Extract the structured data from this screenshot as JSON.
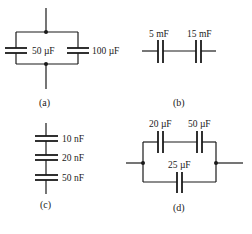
{
  "figure": {
    "panels": [
      {
        "id": "a",
        "caption": "(a)",
        "topology": "parallel",
        "capacitors": [
          {
            "label": "50 µF",
            "value": 50,
            "unit": "µF"
          },
          {
            "label": "100 µF",
            "value": 100,
            "unit": "µF"
          }
        ]
      },
      {
        "id": "b",
        "caption": "(b)",
        "topology": "series",
        "capacitors": [
          {
            "label": "5 mF",
            "value": 5,
            "unit": "mF"
          },
          {
            "label": "15 mF",
            "value": 15,
            "unit": "mF"
          }
        ]
      },
      {
        "id": "c",
        "caption": "(c)",
        "topology": "series-vertical",
        "capacitors": [
          {
            "label": "10 nF",
            "value": 10,
            "unit": "nF"
          },
          {
            "label": "20 nF",
            "value": 20,
            "unit": "nF"
          },
          {
            "label": "50 nF",
            "value": 50,
            "unit": "nF"
          }
        ]
      },
      {
        "id": "d",
        "caption": "(d)",
        "topology": "series-in-parallel",
        "capacitors": [
          {
            "label": "20 µF",
            "value": 20,
            "unit": "µF"
          },
          {
            "label": "50 µF",
            "value": 50,
            "unit": "µF"
          },
          {
            "label": "25 µF",
            "value": 25,
            "unit": "µF"
          }
        ]
      }
    ],
    "colors": {
      "ink": "#1a1a1a",
      "background": "#ffffff"
    }
  }
}
